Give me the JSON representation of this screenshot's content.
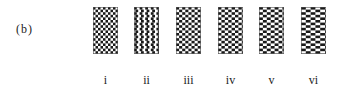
{
  "figure": {
    "panel_label": "(b)",
    "patterns": [
      {
        "label": "i",
        "left": 93,
        "cell_w": 2.5,
        "cell_h": 2.6,
        "stagger": 0.0
      },
      {
        "label": "ii",
        "left": 134,
        "cell_w": 2.8,
        "cell_h": 2.6,
        "stagger": 0.25
      },
      {
        "label": "iii",
        "left": 176,
        "cell_w": 3.1,
        "cell_h": 2.6,
        "stagger": 0.5
      },
      {
        "label": "iv",
        "left": 218,
        "cell_w": 3.4,
        "cell_h": 2.6,
        "stagger": 0.5
      },
      {
        "label": "v",
        "left": 259,
        "cell_w": 3.9,
        "cell_h": 2.6,
        "stagger": 0.5
      },
      {
        "label": "vi",
        "left": 301,
        "cell_w": 4.8,
        "cell_h": 2.6,
        "stagger": 0.5
      }
    ],
    "colors": {
      "dark": "#1a1a1a",
      "light": "#ffffff"
    }
  }
}
